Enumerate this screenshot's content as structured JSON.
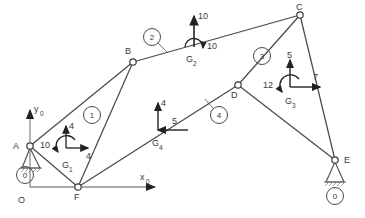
{
  "diagram": {
    "axes": {
      "origin_label": "O",
      "x_label": "x",
      "x_sub": "0",
      "y_label": "y",
      "y_sub": "0"
    },
    "joints": [
      {
        "id": "A",
        "label": "A",
        "x": 30,
        "y": 146,
        "support": "pin"
      },
      {
        "id": "B",
        "label": "B",
        "x": 133,
        "y": 62,
        "support": "none"
      },
      {
        "id": "C",
        "label": "C",
        "x": 300,
        "y": 15,
        "support": "none"
      },
      {
        "id": "D",
        "label": "D",
        "x": 238,
        "y": 85,
        "support": "none"
      },
      {
        "id": "E",
        "label": "E",
        "x": 335,
        "y": 160,
        "support": "pin"
      },
      {
        "id": "F",
        "label": "F",
        "x": 78,
        "y": 187,
        "support": "none"
      }
    ],
    "links": [
      {
        "number": "0",
        "label_x": 25,
        "label_y": 178,
        "kind": "ground"
      },
      {
        "number": "1",
        "label_x": 92,
        "label_y": 118,
        "kind": "body"
      },
      {
        "number": "2",
        "label_x": 152,
        "label_y": 40,
        "kind": "body"
      },
      {
        "number": "3",
        "label_x": 262,
        "label_y": 59,
        "kind": "body"
      },
      {
        "number": "4",
        "label_x": 219,
        "label_y": 118,
        "kind": "body"
      },
      {
        "number": "0",
        "label_x": 335,
        "label_y": 196,
        "kind": "ground"
      }
    ],
    "centers_of_mass": [
      {
        "id": "G1",
        "label": "G",
        "sub": "1",
        "x": 66,
        "y": 148,
        "forces": [
          {
            "value": "4",
            "dir": "up"
          },
          {
            "value": "4",
            "dir": "right"
          }
        ],
        "moment": {
          "value": "10",
          "sense": "ccw"
        }
      },
      {
        "id": "G2",
        "label": "G",
        "sub": "2",
        "x": 194,
        "y": 47,
        "forces": [
          {
            "value": "10",
            "dir": "up"
          }
        ],
        "moment": {
          "value": "10",
          "sense": "cw"
        }
      },
      {
        "id": "G3",
        "label": "G",
        "sub": "3",
        "x": 290,
        "y": 87,
        "forces": [
          {
            "value": "5",
            "dir": "up"
          },
          {
            "value": "7",
            "dir": "right"
          }
        ],
        "moment": {
          "value": "12",
          "sense": "ccw"
        }
      },
      {
        "id": "G4",
        "label": "G",
        "sub": "4",
        "x": 158,
        "y": 130,
        "forces": [
          {
            "value": "4",
            "dir": "up"
          },
          {
            "value": "5",
            "dir": "left"
          }
        ],
        "moment": null
      }
    ],
    "members": [
      {
        "from": "A",
        "to": "B"
      },
      {
        "from": "A",
        "to": "F"
      },
      {
        "from": "B",
        "to": "F"
      },
      {
        "from": "B",
        "to": "C"
      },
      {
        "from": "C",
        "to": "D"
      },
      {
        "from": "C",
        "to": "E"
      },
      {
        "from": "D",
        "to": "E"
      },
      {
        "from": "D",
        "to": "F"
      }
    ]
  }
}
